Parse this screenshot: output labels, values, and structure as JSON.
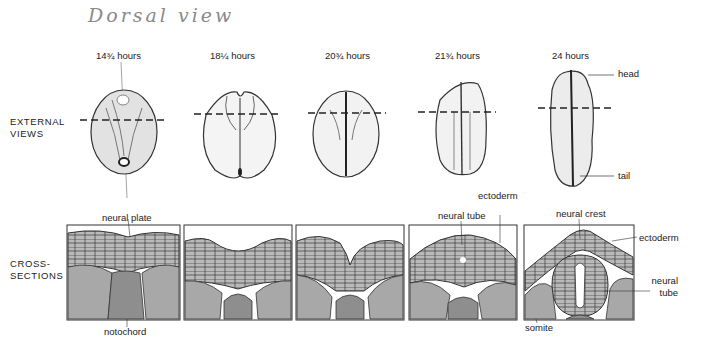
{
  "annotation": {
    "handwritten_note": "Dorsal view"
  },
  "stages": [
    {
      "time": "14¾ hours"
    },
    {
      "time": "18¼ hours"
    },
    {
      "time": "20¾ hours"
    },
    {
      "time": "21¾ hours"
    },
    {
      "time": "24 hours"
    }
  ],
  "rows": {
    "external": {
      "line1": "EXTERNAL",
      "line2": "VIEWS"
    },
    "cross": {
      "line1": "CROSS-",
      "line2": "SECTIONS"
    }
  },
  "external_labels": {
    "head": "head",
    "tail": "tail"
  },
  "section_labels": {
    "neural_plate": "neural plate",
    "notochord": "notochord",
    "neural_tube": "neural tube",
    "ectoderm_1": "ectoderm",
    "neural_crest": "neural crest",
    "ectoderm_2": "ectoderm",
    "neural_tube_2a": "neural",
    "neural_tube_2b": "tube",
    "somite": "somite"
  },
  "colors": {
    "tissue": "#b9b9b9",
    "notochord": "#8e8e8e",
    "somite": "#a8a8a8",
    "outline": "#333333"
  }
}
